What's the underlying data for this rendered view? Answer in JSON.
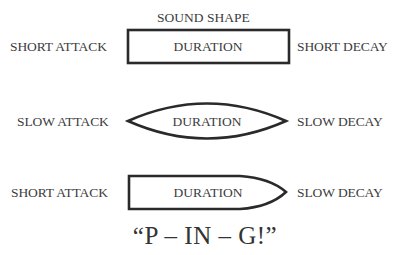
{
  "diagram": {
    "title": "SOUND SHAPE",
    "rows": [
      {
        "shape": "rectangle",
        "attack_label": "SHORT ATTACK",
        "body_label": "DURATION",
        "decay_label": "SHORT DECAY"
      },
      {
        "shape": "lens",
        "attack_label": "SLOW ATTACK",
        "body_label": "DURATION",
        "decay_label": "SLOW DECAY"
      },
      {
        "shape": "bullet",
        "attack_label": "SHORT ATTACK",
        "body_label": "DURATION",
        "decay_label": "SLOW DECAY"
      }
    ],
    "caption": "“P – IN – G!”",
    "stroke_color": "#2a2a2a"
  }
}
